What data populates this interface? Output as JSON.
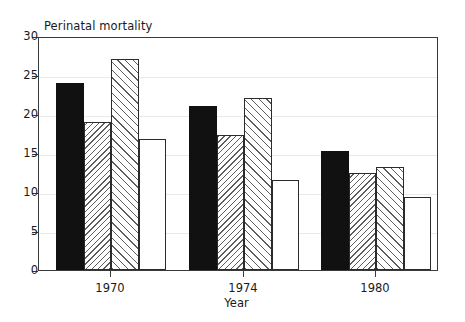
{
  "chart_data": {
    "type": "bar",
    "title": "",
    "ylabel": "Perinatal mortality",
    "xlabel": "Year",
    "categories": [
      "1970",
      "1974",
      "1980"
    ],
    "series": [
      {
        "name": "series-1",
        "fill": "solid",
        "values": [
          24.0,
          21.0,
          15.3
        ]
      },
      {
        "name": "series-2",
        "fill": "hatch-back",
        "values": [
          19.0,
          17.3,
          12.5
        ]
      },
      {
        "name": "series-3",
        "fill": "hatch-fwd",
        "values": [
          27.0,
          22.0,
          13.2
        ]
      },
      {
        "name": "series-4",
        "fill": "empty",
        "values": [
          16.8,
          11.5,
          9.4
        ]
      }
    ],
    "ylim": [
      0,
      30
    ],
    "yticks": [
      0,
      5,
      10,
      15,
      20,
      25,
      30
    ],
    "ytick_labels": [
      "0",
      "5",
      "10",
      "15",
      "20",
      "25",
      "30"
    ],
    "grid": true,
    "legend": "none",
    "frame_color": "#3a3a3a",
    "bar_edge_color": "#2b2b2b",
    "bar_solid_color": "#111111",
    "hatch_color": "#5d5d5d",
    "grid_color": "#e9e9e9"
  }
}
